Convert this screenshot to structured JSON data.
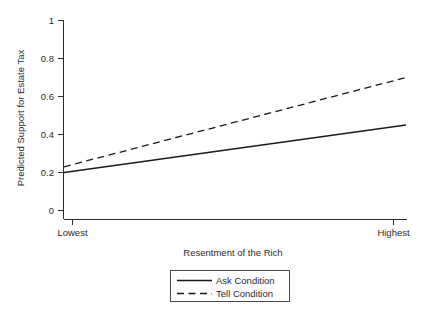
{
  "chart_data": {
    "type": "line",
    "title": "",
    "xlabel": "Resentment of the Rich",
    "ylabel": "Predicted Support for Estate Tax",
    "x": [
      0,
      1
    ],
    "xtick_labels": [
      "Lowest",
      "Highest"
    ],
    "xlim": [
      0,
      1
    ],
    "ylim": [
      0,
      1
    ],
    "ytick_labels": [
      "0",
      "0.2",
      "0.4",
      "0.6",
      "0.8",
      "1"
    ],
    "ytick_values": [
      0,
      0.2,
      0.4,
      0.6,
      0.8,
      1
    ],
    "grid": false,
    "legend_position": "below-axes-center",
    "series": [
      {
        "name": "Ask Condition",
        "style": "solid",
        "values": [
          0.2,
          0.45
        ]
      },
      {
        "name": "Tell Condition",
        "style": "dashed",
        "values": [
          0.23,
          0.7
        ]
      }
    ]
  },
  "legend": {
    "entries": [
      {
        "label": "Ask Condition",
        "style": "solid"
      },
      {
        "label": "Tell Condition",
        "style": "dashed"
      }
    ]
  }
}
